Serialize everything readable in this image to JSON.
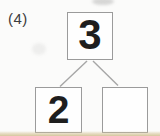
{
  "problem": {
    "label": "(4)",
    "diagram": {
      "type": "number-bond",
      "top_value": "3",
      "left_value": "2",
      "right_value": "",
      "relation": "top splits into left and right"
    }
  },
  "colors": {
    "paper": "#fbfbfa",
    "box_border": "#9b9b9b",
    "connector_line": "#a6a6a6",
    "digit": "#1e1e1e",
    "bottom_paper_edge": "#d6c79e"
  }
}
